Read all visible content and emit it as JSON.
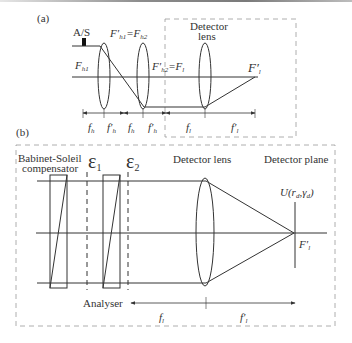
{
  "figure": {
    "panel_a": {
      "label": "(a)",
      "aperture_stop_label": "A/S",
      "focus_labels": {
        "fh1": "F",
        "fh1_sub": "h1",
        "fh1p_eq_fh2": "F′h1=Fh2",
        "fh2p_eq_fl": "F′h2=Fl",
        "flp": "F′l"
      },
      "detector_lens_label_line1": "Detector",
      "detector_lens_label_line2": "lens",
      "distance_labels": [
        "fh",
        "f′h",
        "fh",
        "f′h",
        "fl",
        "f′l"
      ]
    },
    "panel_b": {
      "label": "(b)",
      "compensator_label_line1": "Babinet-Soleil",
      "compensator_label_line2": "compensator",
      "epsilon1": "ε",
      "epsilon1_sub": "1",
      "epsilon2": "ε",
      "epsilon2_sub": "2",
      "detector_lens_label": "Detector lens",
      "detector_plane_label": "Detector plane",
      "field_label": "U(rd,γd)",
      "focus_label": "F′l",
      "analyser_label": "Analyser",
      "distance_labels": [
        "fl",
        "f′l"
      ]
    }
  }
}
